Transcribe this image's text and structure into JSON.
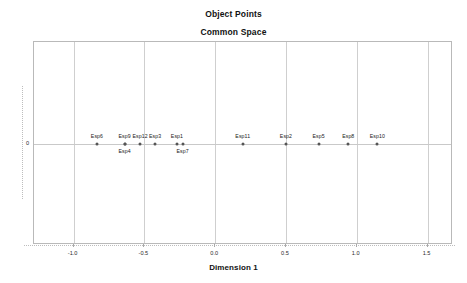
{
  "chart_data": {
    "type": "scatter",
    "title": "Object Points",
    "subtitle": "Common Space",
    "xlabel": "Dimension 1",
    "ylabel": "",
    "xlim": [
      -1.28,
      1.68
    ],
    "ylim": [
      -1.0,
      1.0
    ],
    "grid": true,
    "legend": null,
    "xticks": [
      {
        "value": -1.0,
        "label": "-1.0"
      },
      {
        "value": -0.5,
        "label": "-0.5"
      },
      {
        "value": 0.0,
        "label": "0.0"
      },
      {
        "value": 0.5,
        "label": "0.5"
      },
      {
        "value": 1.0,
        "label": "1.0"
      },
      {
        "value": 1.5,
        "label": "1.5"
      }
    ],
    "yticks": [
      {
        "value": 0,
        "label": "0"
      }
    ],
    "points": [
      {
        "label": "Esp6",
        "x": -0.835,
        "y": 0,
        "label_pos": "above"
      },
      {
        "label": "Esp9",
        "x": -0.64,
        "y": 0,
        "label_pos": "above"
      },
      {
        "label": "Esp4",
        "x": -0.64,
        "y": 0,
        "label_pos": "below"
      },
      {
        "label": "Esp12",
        "x": -0.53,
        "y": 0,
        "label_pos": "above"
      },
      {
        "label": "Esp3",
        "x": -0.425,
        "y": 0,
        "label_pos": "above"
      },
      {
        "label": "Esp1",
        "x": -0.27,
        "y": 0,
        "label_pos": "above"
      },
      {
        "label": "Esp7",
        "x": -0.23,
        "y": 0,
        "label_pos": "below"
      },
      {
        "label": "Esp11",
        "x": 0.195,
        "y": 0,
        "label_pos": "above"
      },
      {
        "label": "Esp2",
        "x": 0.5,
        "y": 0,
        "label_pos": "above"
      },
      {
        "label": "Esp5",
        "x": 0.73,
        "y": 0,
        "label_pos": "above"
      },
      {
        "label": "Esp8",
        "x": 0.94,
        "y": 0,
        "label_pos": "above"
      },
      {
        "label": "Esp10",
        "x": 1.145,
        "y": 0,
        "label_pos": "above"
      }
    ],
    "colors": {
      "marker": "#555555",
      "frame": "#b9b9b9",
      "grid": "#cfcfcf",
      "axis": "#c9c9c9",
      "text": "#121212",
      "background": "#ffffff"
    }
  }
}
